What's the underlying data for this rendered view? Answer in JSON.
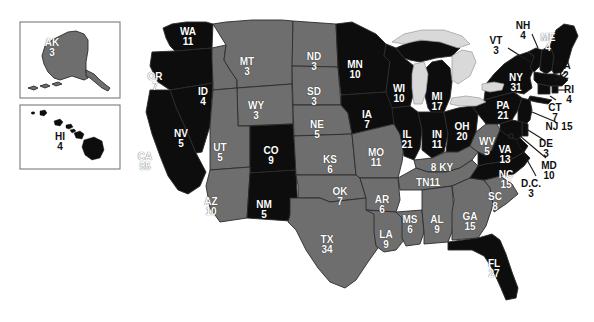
{
  "map": {
    "title": "United States Electoral College Map",
    "background_color": "#ffffff",
    "colors": {
      "party_a_fill": "#0d0d0d",
      "party_b_fill": "#6e6e6e",
      "lake_fill": "#d9d9d9",
      "border_stroke": "#2b2b2b",
      "label_light": "#ffffff",
      "label_dark": "#111111",
      "inset_border": "#7a7a7a"
    },
    "insets": [
      {
        "name": "alaska-inset",
        "state": "AK"
      },
      {
        "name": "hawaii-inset",
        "state": "HI"
      }
    ],
    "states": [
      {
        "ab": "AK",
        "ev": "3",
        "fill": "party_b",
        "label_color": "light",
        "x": 52,
        "y": 38,
        "layout": "stacked"
      },
      {
        "ab": "HI",
        "ev": "4",
        "fill": "party_a",
        "label_color": "dark",
        "x": 60,
        "y": 132,
        "layout": "stacked"
      },
      {
        "ab": "WA",
        "ev": "11",
        "fill": "party_a",
        "label_color": "light",
        "x": 188,
        "y": 27,
        "layout": "stacked"
      },
      {
        "ab": "OR",
        "ev": "7",
        "fill": "party_a",
        "label_color": "light",
        "x": 155,
        "y": 72,
        "layout": "stacked"
      },
      {
        "ab": "CA",
        "ev": "55",
        "fill": "party_a",
        "label_color": "light",
        "x": 145,
        "y": 152,
        "layout": "stacked"
      },
      {
        "ab": "NV",
        "ev": "5",
        "fill": "party_a",
        "label_color": "light",
        "x": 181,
        "y": 129,
        "layout": "stacked"
      },
      {
        "ab": "ID",
        "ev": "4",
        "fill": "party_b",
        "label_color": "light",
        "x": 203,
        "y": 87,
        "layout": "stacked"
      },
      {
        "ab": "MT",
        "ev": "3",
        "fill": "party_b",
        "label_color": "light",
        "x": 247,
        "y": 57,
        "layout": "stacked"
      },
      {
        "ab": "WY",
        "ev": "3",
        "fill": "party_b",
        "label_color": "light",
        "x": 256,
        "y": 101,
        "layout": "stacked"
      },
      {
        "ab": "UT",
        "ev": "5",
        "fill": "party_b",
        "label_color": "light",
        "x": 220,
        "y": 143,
        "layout": "stacked"
      },
      {
        "ab": "CO",
        "ev": "9",
        "fill": "party_a",
        "label_color": "light",
        "x": 271,
        "y": 146,
        "layout": "stacked"
      },
      {
        "ab": "AZ",
        "ev": "10",
        "fill": "party_b",
        "label_color": "light",
        "x": 211,
        "y": 197,
        "layout": "stacked"
      },
      {
        "ab": "NM",
        "ev": "5",
        "fill": "party_a",
        "label_color": "light",
        "x": 264,
        "y": 200,
        "layout": "stacked"
      },
      {
        "ab": "ND",
        "ev": "3",
        "fill": "party_b",
        "label_color": "light",
        "x": 314,
        "y": 52,
        "layout": "stacked"
      },
      {
        "ab": "SD",
        "ev": "3",
        "fill": "party_b",
        "label_color": "light",
        "x": 314,
        "y": 87,
        "layout": "stacked"
      },
      {
        "ab": "NE",
        "ev": "5",
        "fill": "party_b",
        "label_color": "light",
        "x": 317,
        "y": 120,
        "layout": "stacked"
      },
      {
        "ab": "KS",
        "ev": "6",
        "fill": "party_b",
        "label_color": "light",
        "x": 330,
        "y": 155,
        "layout": "stacked"
      },
      {
        "ab": "OK",
        "ev": "7",
        "fill": "party_b",
        "label_color": "light",
        "x": 340,
        "y": 187,
        "layout": "stacked"
      },
      {
        "ab": "TX",
        "ev": "34",
        "fill": "party_b",
        "label_color": "light",
        "x": 327,
        "y": 235,
        "layout": "stacked"
      },
      {
        "ab": "MN",
        "ev": "10",
        "fill": "party_a",
        "label_color": "light",
        "x": 355,
        "y": 60,
        "layout": "stacked"
      },
      {
        "ab": "IA",
        "ev": "7",
        "fill": "party_a",
        "label_color": "light",
        "x": 367,
        "y": 110,
        "layout": "stacked"
      },
      {
        "ab": "MO",
        "ev": "11",
        "fill": "party_b",
        "label_color": "light",
        "x": 376,
        "y": 148,
        "layout": "stacked"
      },
      {
        "ab": "AR",
        "ev": "6",
        "fill": "party_b",
        "label_color": "light",
        "x": 382,
        "y": 195,
        "layout": "stacked"
      },
      {
        "ab": "LA",
        "ev": "9",
        "fill": "party_b",
        "label_color": "light",
        "x": 386,
        "y": 230,
        "layout": "stacked"
      },
      {
        "ab": "WI",
        "ev": "10",
        "fill": "party_a",
        "label_color": "light",
        "x": 399,
        "y": 84,
        "layout": "stacked"
      },
      {
        "ab": "IL",
        "ev": "21",
        "fill": "party_a",
        "label_color": "light",
        "x": 407,
        "y": 130,
        "layout": "stacked"
      },
      {
        "ab": "MS",
        "ev": "6",
        "fill": "party_b",
        "label_color": "light",
        "x": 410,
        "y": 215,
        "layout": "stacked"
      },
      {
        "ab": "MI",
        "ev": "17",
        "fill": "party_a",
        "label_color": "light",
        "x": 437,
        "y": 92,
        "layout": "stacked"
      },
      {
        "ab": "IN",
        "ev": "11",
        "fill": "party_a",
        "label_color": "light",
        "x": 437,
        "y": 130,
        "layout": "stacked"
      },
      {
        "ab": "KY",
        "ev": "8",
        "fill": "party_b",
        "label_color": "light",
        "x": 442,
        "y": 163,
        "layout": "ev-left"
      },
      {
        "ab": "TN",
        "ev": "11",
        "fill": "party_b",
        "label_color": "light",
        "x": 428,
        "y": 178,
        "layout": "ev-right"
      },
      {
        "ab": "AL",
        "ev": "9",
        "fill": "party_b",
        "label_color": "light",
        "x": 437,
        "y": 215,
        "layout": "stacked"
      },
      {
        "ab": "GA",
        "ev": "15",
        "fill": "party_b",
        "label_color": "light",
        "x": 470,
        "y": 212,
        "layout": "stacked"
      },
      {
        "ab": "FL",
        "ev": "27",
        "fill": "party_a",
        "label_color": "light",
        "x": 494,
        "y": 259,
        "layout": "stacked"
      },
      {
        "ab": "OH",
        "ev": "20",
        "fill": "party_a",
        "label_color": "light",
        "x": 462,
        "y": 122,
        "layout": "stacked"
      },
      {
        "ab": "WV",
        "ev": "5",
        "fill": "party_b",
        "label_color": "light",
        "x": 487,
        "y": 137,
        "layout": "stacked"
      },
      {
        "ab": "VA",
        "ev": "13",
        "fill": "party_a",
        "label_color": "light",
        "x": 505,
        "y": 145,
        "layout": "stacked"
      },
      {
        "ab": "NC",
        "ev": "15",
        "fill": "party_a",
        "label_color": "light",
        "x": 506,
        "y": 170,
        "layout": "stacked"
      },
      {
        "ab": "SC",
        "ev": "8",
        "fill": "party_b",
        "label_color": "light",
        "x": 495,
        "y": 192,
        "layout": "stacked"
      },
      {
        "ab": "PA",
        "ev": "21",
        "fill": "party_a",
        "label_color": "light",
        "x": 503,
        "y": 101,
        "layout": "stacked"
      },
      {
        "ab": "NY",
        "ev": "31",
        "fill": "party_a",
        "label_color": "light",
        "x": 516,
        "y": 73,
        "layout": "stacked"
      }
    ],
    "callout_states": [
      {
        "ab": "NH",
        "ev": "4",
        "label_color": "dark",
        "x": 523,
        "y": 21,
        "layout": "stacked"
      },
      {
        "ab": "VT",
        "ev": "3",
        "label_color": "dark",
        "x": 496,
        "y": 36,
        "layout": "stacked"
      },
      {
        "ab": "ME",
        "ev": "4",
        "label_color": "light",
        "x": 548,
        "y": 33,
        "layout": "stacked"
      },
      {
        "ab": "MA",
        "ev": "12",
        "label_color": "dark",
        "x": 563,
        "y": 61,
        "layout": "stacked"
      },
      {
        "ab": "RI",
        "ev": "4",
        "label_color": "dark",
        "x": 569,
        "y": 85,
        "layout": "stacked"
      },
      {
        "ab": "CT",
        "ev": "7",
        "label_color": "dark",
        "x": 555,
        "y": 103,
        "layout": "stacked"
      },
      {
        "ab": "NJ",
        "ev": "15",
        "label_color": "dark",
        "x": 559,
        "y": 122,
        "layout": "inline"
      },
      {
        "ab": "DE",
        "ev": "3",
        "label_color": "dark",
        "x": 546,
        "y": 139,
        "layout": "stacked"
      },
      {
        "ab": "MD",
        "ev": "10",
        "label_color": "dark",
        "x": 549,
        "y": 161,
        "layout": "stacked"
      },
      {
        "ab": "D.C.",
        "ev": "3",
        "label_color": "dark",
        "x": 531,
        "y": 179,
        "layout": "stacked"
      }
    ]
  }
}
